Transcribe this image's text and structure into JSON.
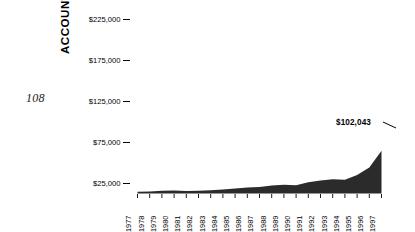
{
  "folio": "108",
  "axes": {
    "ylabel": "ACCOUNT VALUE",
    "yticks": [
      "$225,000",
      "$175,000",
      "$125,000",
      "$75,000",
      "$25,000"
    ],
    "ytick_dash": "–"
  },
  "callout": {
    "value_label": "$102,043"
  },
  "colors": {
    "area_fill": "#2b2b2b",
    "background": "#ffffff",
    "text": "#000000"
  },
  "chart_data": {
    "type": "area",
    "title": "",
    "xlabel": "",
    "ylabel": "ACCOUNT VALUE",
    "grid": false,
    "legend": null,
    "ylim": [
      0,
      237500
    ],
    "ytick_values": [
      225000,
      175000,
      125000,
      75000,
      25000
    ],
    "ytick_labels": [
      "$225,000",
      "$175,000",
      "$125,000",
      "$75,000",
      "$25,000"
    ],
    "categories": [
      "1977",
      "1978",
      "1979",
      "1980",
      "1981",
      "1982",
      "1983",
      "1984",
      "1985",
      "1986",
      "1987",
      "1988",
      "1989",
      "1990",
      "1991",
      "1992",
      "1993",
      "1994",
      "1995",
      "1996",
      "1997"
    ],
    "values": [
      4000,
      4500,
      6500,
      7000,
      6000,
      6500,
      8000,
      9500,
      12000,
      14000,
      15500,
      19000,
      21000,
      19500,
      27000,
      31000,
      34000,
      33000,
      44000,
      62000,
      102043
    ],
    "annotations": [
      {
        "label": "$102,043",
        "x": "1997",
        "y": 102043
      }
    ]
  }
}
